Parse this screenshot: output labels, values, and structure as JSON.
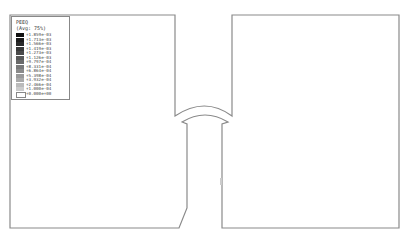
{
  "legend": {
    "title": "PEEQ",
    "subtitle": "(Avg: 75%)",
    "entries": [
      {
        "label": "+1.859e-03",
        "color": "#111111"
      },
      {
        "label": "+1.713e-03",
        "color": "#1c1c1c"
      },
      {
        "label": "+1.566e-03",
        "color": "#2a2a2a"
      },
      {
        "label": "+1.419e-03",
        "color": "#3a3a3a"
      },
      {
        "label": "+1.273e-03",
        "color": "#4a4a4a"
      },
      {
        "label": "+1.126e-03",
        "color": "#5a5a5a"
      },
      {
        "label": "+9.797e-04",
        "color": "#6a6a6a"
      },
      {
        "label": "+8.331e-04",
        "color": "#7a7a7a"
      },
      {
        "label": "+6.864e-04",
        "color": "#8a8a8a"
      },
      {
        "label": "+5.398e-04",
        "color": "#9a9a9a"
      },
      {
        "label": "+3.932e-04",
        "color": "#aaaaaa"
      },
      {
        "label": "+2.466e-04",
        "color": "#bbbbbb"
      },
      {
        "label": "+1.000e-04",
        "color": "#cccccc"
      },
      {
        "label": "+0.000e+00",
        "color": "#ffffff"
      }
    ]
  },
  "colors": {
    "outline": "#8a8a8a",
    "background": "#ffffff"
  }
}
